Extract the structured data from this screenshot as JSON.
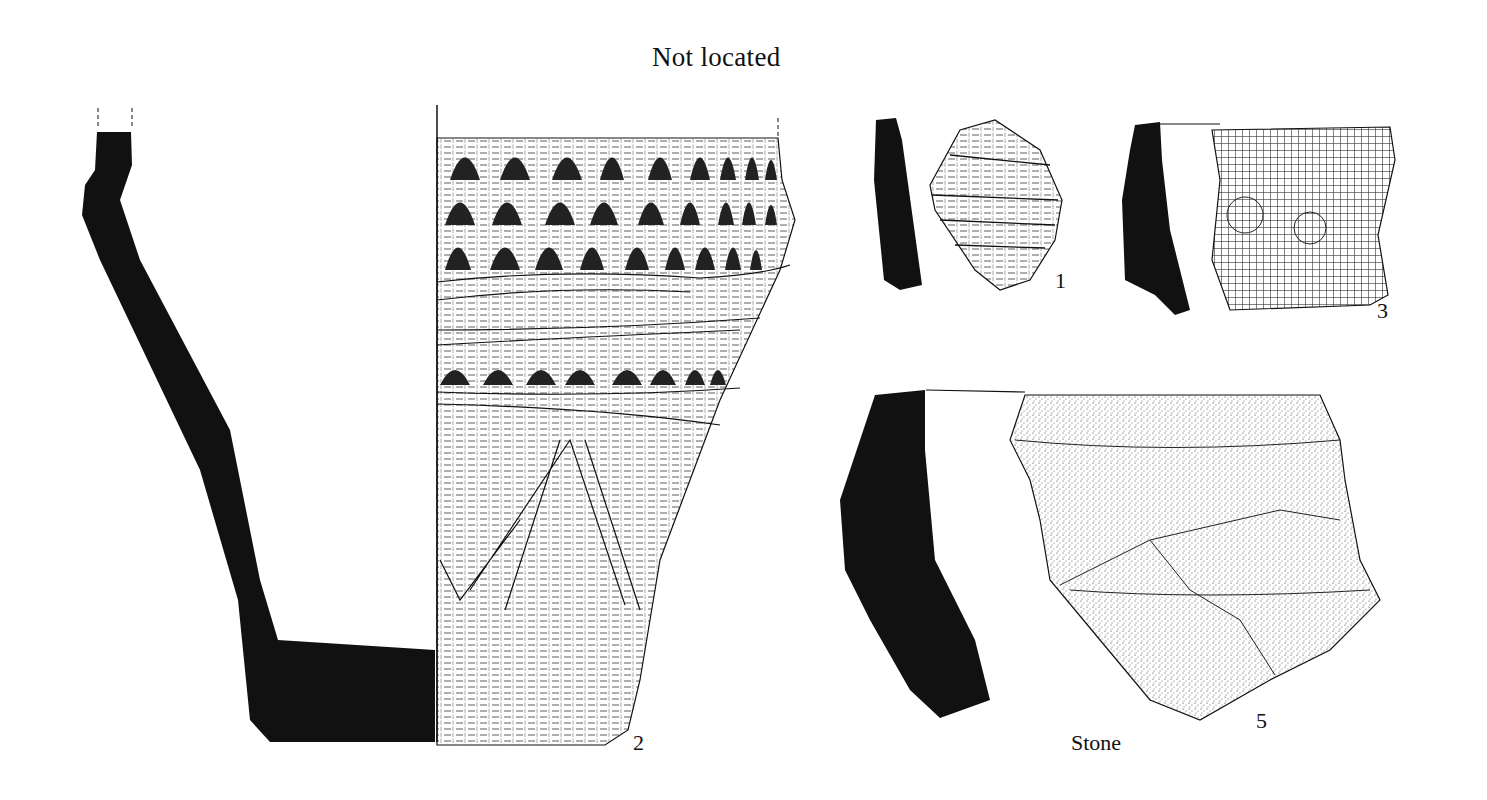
{
  "plate": {
    "title": "Not located",
    "labels": {
      "fig1": "1",
      "fig2": "2",
      "fig3": "3",
      "fig5": "5",
      "material": "Stone"
    },
    "colors": {
      "ink": "#111111",
      "paper": "#ffffff"
    }
  }
}
